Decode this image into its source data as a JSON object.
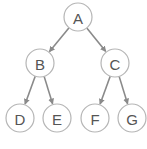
{
  "diagram": {
    "type": "binary-tree",
    "colors": {
      "node_stroke": "#b5b5b5",
      "edge": "#8a8a8a",
      "label": "#555555",
      "background": "#ffffff"
    },
    "nodes": [
      {
        "id": "A",
        "label": "A",
        "x": 78,
        "y": 17
      },
      {
        "id": "B",
        "label": "B",
        "x": 40,
        "y": 63
      },
      {
        "id": "C",
        "label": "C",
        "x": 115,
        "y": 63
      },
      {
        "id": "D",
        "label": "D",
        "x": 20,
        "y": 118
      },
      {
        "id": "E",
        "label": "E",
        "x": 57,
        "y": 118
      },
      {
        "id": "F",
        "label": "F",
        "x": 95,
        "y": 118
      },
      {
        "id": "G",
        "label": "G",
        "x": 132,
        "y": 118
      }
    ],
    "edges": [
      {
        "from": "A",
        "to": "B"
      },
      {
        "from": "A",
        "to": "C"
      },
      {
        "from": "B",
        "to": "D"
      },
      {
        "from": "B",
        "to": "E"
      },
      {
        "from": "C",
        "to": "F"
      },
      {
        "from": "C",
        "to": "G"
      }
    ]
  }
}
